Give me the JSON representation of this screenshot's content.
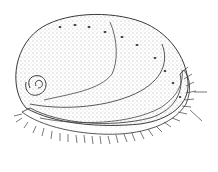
{
  "figure": {
    "colors": {
      "background": "#ffffff",
      "ink": "#3a3a3a",
      "stipple": "#555555"
    }
  }
}
